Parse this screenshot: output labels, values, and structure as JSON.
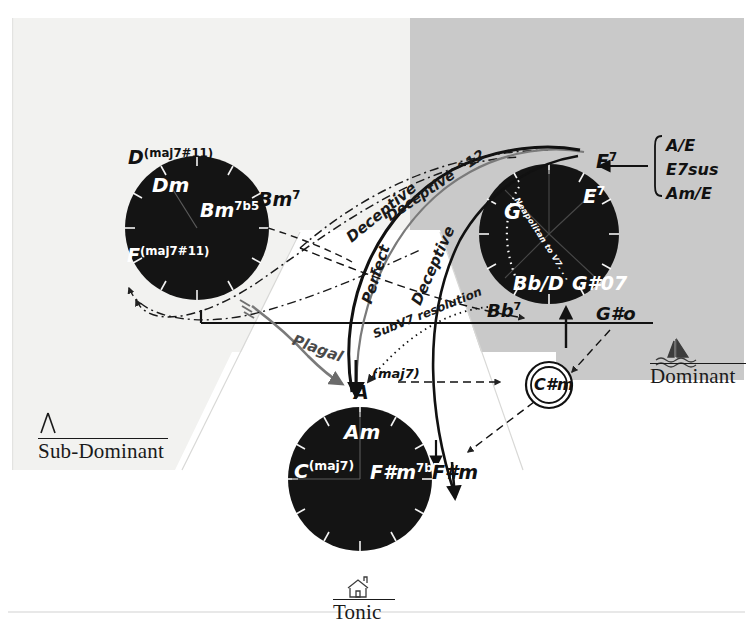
{
  "diagram": {
    "regions": [
      {
        "id": "sub-dominant",
        "label": "Sub-Dominant",
        "icon": "tent-icon"
      },
      {
        "id": "dominant",
        "label": "Dominant",
        "icon": "sailboat-icon"
      },
      {
        "id": "tonic",
        "label": "Tonic",
        "icon": "house-icon"
      }
    ],
    "colors": {
      "paper": "#ffffff",
      "panel_light": "#f2f2f0",
      "panel_grey": "#c9c9c9",
      "disc": "#141414",
      "ink": "#1a1a1a",
      "label_white": "#ffffff"
    }
  },
  "subdominant_wheel": {
    "name": "sub-dominant-wheel",
    "center": [
      197,
      228
    ],
    "radius": 72,
    "inside_labels": [
      {
        "id": "dm",
        "root": "D",
        "quality": "m"
      },
      {
        "id": "bm7b5",
        "root": "B",
        "quality": "m",
        "sup": "7b5"
      },
      {
        "id": "fmaj7s11",
        "root": "F",
        "ext": "(maj7#11)"
      }
    ],
    "outside_labels": [
      {
        "id": "dmaj7s11",
        "root": "D",
        "ext": "(maj7#11)"
      },
      {
        "id": "bm7",
        "root": "B",
        "quality": "m",
        "sup": "7"
      }
    ]
  },
  "dominant_wheel": {
    "name": "dominant-wheel",
    "center": [
      549,
      234
    ],
    "radius": 70,
    "inside_labels": [
      {
        "id": "g",
        "root": "G"
      },
      {
        "id": "e7-inner",
        "root": "E",
        "sup": "7"
      },
      {
        "id": "bbslashd",
        "root": "Bb/D"
      },
      {
        "id": "gsharp07",
        "root": "G#07"
      }
    ],
    "outside_labels": [
      {
        "id": "e7-outer",
        "root": "E",
        "sup": "7"
      },
      {
        "id": "bb7",
        "root": "Bb",
        "sup": "7"
      },
      {
        "id": "gsharp0",
        "root": "G#o"
      }
    ],
    "inner_annotation": "Neapolitan to V7. . ."
  },
  "tonic_wheel": {
    "name": "tonic-wheel",
    "center": [
      360,
      479
    ],
    "radius": 72,
    "inside_labels": [
      {
        "id": "am",
        "root": "A",
        "quality": "m"
      },
      {
        "id": "cmaj7",
        "root": "C",
        "ext": "(maj7)"
      },
      {
        "id": "fsharpm7b5",
        "root": "F#",
        "quality": "m",
        "sup": "7b5"
      }
    ],
    "outside_labels": [
      {
        "id": "a-maj7",
        "root": "A",
        "ext": "(maj7)"
      },
      {
        "id": "fsharpm",
        "root": "F#",
        "quality": "m"
      }
    ]
  },
  "nodes": [
    {
      "id": "csharpm",
      "label": "C#m",
      "shape": "double-circle",
      "x": 549,
      "y": 385
    }
  ],
  "dominant_substitutions": {
    "name": "dominant-substitution-bracket",
    "items": [
      "A/E",
      "E7sus",
      "Am/E"
    ],
    "target": "E7"
  },
  "cadence_labels": [
    {
      "id": "deceptive-12",
      "text": "Deceptive ^12"
    },
    {
      "id": "deceptive-upper",
      "text": "Deceptive"
    },
    {
      "id": "deceptive-lower",
      "text": "Deceptive"
    },
    {
      "id": "perfect",
      "text": "Perfect"
    },
    {
      "id": "plagal",
      "text": "Plagal"
    },
    {
      "id": "subv7",
      "text": "SubV7 resolution"
    }
  ]
}
